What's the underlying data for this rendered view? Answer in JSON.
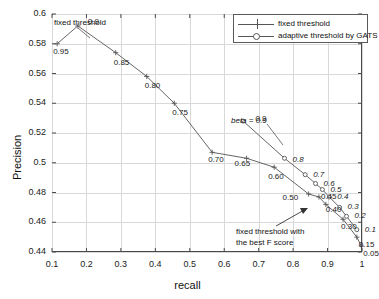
{
  "chart_data": {
    "type": "line",
    "title": "",
    "xlabel": "recall",
    "ylabel": "Precision",
    "xlim": [
      0.1,
      1.0
    ],
    "ylim": [
      0.44,
      0.6
    ],
    "grid": true,
    "legend_position": "top-right",
    "xticks": [
      "0.1",
      "0.2",
      "0.3",
      "0.4",
      "0.5",
      "0.6",
      "0.7",
      "0.8",
      "0.9",
      "1"
    ],
    "xtick_values": [
      0.1,
      0.2,
      0.3,
      0.4,
      0.5,
      0.6,
      0.7,
      0.8,
      0.9,
      1.0
    ],
    "yticks": [
      "0.44",
      "0.46",
      "0.48",
      "0.5",
      "0.52",
      "0.54",
      "0.56",
      "0.58",
      "0.6"
    ],
    "ytick_values": [
      0.44,
      0.46,
      0.48,
      0.5,
      0.52,
      0.54,
      0.56,
      0.58,
      0.6
    ],
    "series": [
      {
        "name": "fixed threshold",
        "marker": "plus",
        "color": "#555555",
        "point_labels": [
          "0.95",
          "0.9",
          "0.85",
          "0.80",
          "0.75",
          "0.70",
          "0.65",
          "0.60",
          "0.50",
          "0.45",
          "0.40",
          "0.30",
          "0.15",
          "0.05"
        ],
        "x": [
          0.115,
          0.175,
          0.285,
          0.375,
          0.455,
          0.565,
          0.665,
          0.745,
          0.845,
          0.875,
          0.895,
          0.945,
          0.985,
          0.998
        ],
        "y": [
          0.58,
          0.592,
          0.574,
          0.558,
          0.54,
          0.507,
          0.503,
          0.497,
          0.479,
          0.477,
          0.472,
          0.462,
          0.45,
          0.444
        ]
      },
      {
        "name": "adaptive threshold by GATS",
        "marker": "circle",
        "color": "#555555",
        "point_labels": [
          "0.9",
          "0.8",
          "0.7",
          "0.6",
          "0.5",
          "0.4",
          "0.3",
          "0.2",
          "0.1"
        ],
        "x": [
          0.655,
          0.775,
          0.835,
          0.865,
          0.885,
          0.905,
          0.935,
          0.955,
          0.985
        ],
        "y": [
          0.528,
          0.503,
          0.492,
          0.486,
          0.482,
          0.477,
          0.47,
          0.464,
          0.455
        ]
      }
    ],
    "annotations": [
      {
        "name": "fixed-threshold-note",
        "text": "fixed threshold",
        "italic": false
      },
      {
        "name": "beta-note",
        "text": "beta = 0.9",
        "italic": true
      },
      {
        "name": "best-f-note-line1",
        "text": "fixed threshold with",
        "italic": false
      },
      {
        "name": "best-f-note-line2",
        "text": "the best F score",
        "italic": false
      }
    ]
  },
  "legend": {
    "entries": [
      {
        "label": "fixed threshold",
        "marker": "plus"
      },
      {
        "label": "adaptive threshold by GATS",
        "marker": "circle"
      }
    ]
  }
}
